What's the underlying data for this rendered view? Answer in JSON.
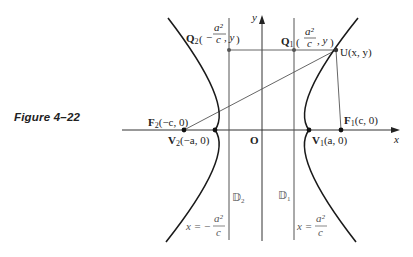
{
  "caption": "Figure 4–22",
  "axes": {
    "x_label": "x",
    "y_label": "y",
    "origin_label": "O"
  },
  "points": {
    "F2": {
      "name": "F",
      "sub": "2",
      "coords": "(−c, 0)"
    },
    "V2": {
      "name": "V",
      "sub": "2",
      "coords": "(−a, 0)"
    },
    "V1": {
      "name": "V",
      "sub": "1",
      "coords": "(a, 0)"
    },
    "F1": {
      "name": "F",
      "sub": "1",
      "coords": "(c, 0)"
    },
    "U": {
      "name": "U",
      "coords": "(x, y)"
    },
    "Q1": {
      "name": "Q",
      "sub": "1",
      "num": "a²",
      "den": "c",
      "tail": ", y"
    },
    "Q2": {
      "name": "Q",
      "sub": "2",
      "sign": "−",
      "num": "a²",
      "den": "c",
      "tail": ", y"
    }
  },
  "directrices": {
    "D2": {
      "name": "𝔻",
      "sub": "2",
      "eq_lhs": "x = −",
      "num": "a²",
      "den": "c"
    },
    "D1": {
      "name": "𝔻",
      "sub": "1",
      "eq_lhs": "x =",
      "num": "a²",
      "den": "c"
    }
  },
  "colors": {
    "curve": "#1a1a1a",
    "line": "#444444",
    "text": "#222222"
  }
}
